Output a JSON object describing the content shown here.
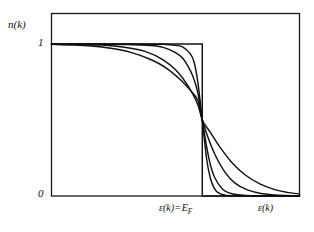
{
  "figure": {
    "background_color": "#ffffff",
    "line_color": "#111111",
    "axis_color": "#1a1a1a"
  },
  "labels": {
    "y_axis_label": "n(k)",
    "y_tick_top": "1",
    "y_tick_bottom": "0",
    "x_tick_fermi_epsilon": "ε(k)",
    "x_tick_fermi_equals": "=",
    "x_tick_fermi_E": "E",
    "x_tick_fermi_subscript": "F",
    "x_axis_label": "ε(k)"
  },
  "chart_data": {
    "type": "line",
    "title": "",
    "xlabel": "ε(k)",
    "ylabel": "n(k)",
    "xlim": [
      0,
      1
    ],
    "ylim": [
      0,
      1
    ],
    "grid": false,
    "legend": "none",
    "annotations": [
      {
        "text": "ε(k) = E_F",
        "x": 0.61,
        "y": -0.06,
        "note": "Fermi energy marker on x-axis"
      },
      {
        "text": "1",
        "x": -0.04,
        "y": 1.0,
        "note": "y-axis tick"
      },
      {
        "text": "0",
        "x": -0.04,
        "y": 0.0,
        "note": "y-axis tick"
      }
    ],
    "crossing_point": {
      "x": 0.61,
      "y": 0.5,
      "note": "all curves intersect at epsilon = E_F, n = 0.5"
    },
    "series": [
      {
        "name": "T = 0 (step function)",
        "smearing": 0.0,
        "x": [
          0.0,
          0.608,
          0.608,
          1.0
        ],
        "values": [
          1.0,
          1.0,
          0.0,
          0.0
        ]
      },
      {
        "name": "low temperature",
        "smearing": 0.022,
        "x": [
          0.0,
          0.1,
          0.2,
          0.3,
          0.4,
          0.45,
          0.5,
          0.53,
          0.56,
          0.575,
          0.59,
          0.608,
          0.625,
          0.64,
          0.655,
          0.67,
          0.7,
          0.75,
          0.8,
          0.9,
          1.0
        ],
        "values": [
          1.0,
          1.0,
          1.0,
          1.0,
          0.999,
          0.998,
          0.991,
          0.98,
          0.935,
          0.88,
          0.75,
          0.5,
          0.25,
          0.12,
          0.055,
          0.024,
          0.005,
          0.001,
          0.0,
          0.0,
          0.0
        ]
      },
      {
        "name": "medium temperature",
        "smearing": 0.04,
        "x": [
          0.0,
          0.1,
          0.2,
          0.3,
          0.4,
          0.45,
          0.5,
          0.53,
          0.56,
          0.575,
          0.59,
          0.608,
          0.625,
          0.64,
          0.66,
          0.69,
          0.72,
          0.76,
          0.82,
          0.9,
          1.0
        ],
        "values": [
          1.0,
          1.0,
          0.999,
          0.997,
          0.99,
          0.978,
          0.944,
          0.905,
          0.825,
          0.765,
          0.68,
          0.5,
          0.33,
          0.21,
          0.115,
          0.045,
          0.018,
          0.006,
          0.001,
          0.0,
          0.0
        ]
      },
      {
        "name": "high temperature",
        "smearing": 0.07,
        "x": [
          0.0,
          0.1,
          0.2,
          0.3,
          0.38,
          0.45,
          0.5,
          0.54,
          0.57,
          0.59,
          0.608,
          0.63,
          0.66,
          0.7,
          0.74,
          0.79,
          0.84,
          0.9,
          0.95,
          1.0
        ],
        "values": [
          1.0,
          0.998,
          0.993,
          0.977,
          0.95,
          0.896,
          0.83,
          0.75,
          0.67,
          0.6,
          0.5,
          0.39,
          0.27,
          0.155,
          0.085,
          0.04,
          0.018,
          0.007,
          0.003,
          0.001
        ]
      },
      {
        "name": "highest temperature",
        "smearing": 0.12,
        "x": [
          0.0,
          0.08,
          0.16,
          0.24,
          0.32,
          0.4,
          0.46,
          0.52,
          0.56,
          0.59,
          0.608,
          0.64,
          0.68,
          0.73,
          0.78,
          0.84,
          0.9,
          0.95,
          1.0
        ],
        "values": [
          0.998,
          0.994,
          0.987,
          0.972,
          0.945,
          0.898,
          0.845,
          0.765,
          0.695,
          0.63,
          0.5,
          0.42,
          0.32,
          0.215,
          0.14,
          0.08,
          0.042,
          0.024,
          0.014
        ]
      }
    ]
  }
}
